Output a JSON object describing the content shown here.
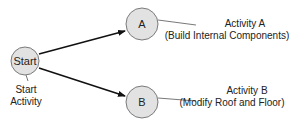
{
  "diagram": {
    "type": "activity-network",
    "nodes": [
      {
        "id": "start",
        "label": "Start",
        "caption_lines": [
          "Start",
          "Activity"
        ]
      },
      {
        "id": "a",
        "label": "A",
        "caption_lines": [
          "Activity A",
          "(Build Internal Components)"
        ]
      },
      {
        "id": "b",
        "label": "B",
        "caption_lines": [
          "Activity B",
          "(Modify Roof and Floor)"
        ]
      }
    ],
    "edges": [
      {
        "from": "start",
        "to": "a"
      },
      {
        "from": "start",
        "to": "b"
      }
    ],
    "colors": {
      "node_fill": "#e2e2e2",
      "node_stroke": "#7a7a7a",
      "edge": "#111111",
      "text": "#222222"
    }
  }
}
